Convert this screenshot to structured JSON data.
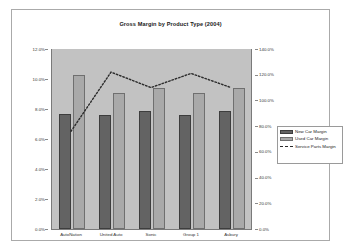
{
  "chart_data": {
    "type": "bar",
    "title": "Gross Margin by Product Type (2004)",
    "xlabel": "",
    "ylabel": "",
    "categories": [
      "AutoNation",
      "United Auto",
      "Sonic",
      "Group 1",
      "Asbury"
    ],
    "series": [
      {
        "name": "New Car Margin",
        "type": "bar",
        "axis": "left",
        "color": "#636363",
        "values": [
          7.7,
          7.6,
          7.9,
          7.6,
          7.9
        ]
      },
      {
        "name": "Used Car Margin",
        "type": "bar",
        "axis": "left",
        "color": "#a9a9a9",
        "values": [
          10.3,
          9.1,
          9.4,
          9.1,
          9.4
        ]
      },
      {
        "name": "Service Parts Margin",
        "type": "line",
        "axis": "right",
        "color": "#2b2b2b",
        "style": "dotted",
        "values": [
          76.0,
          122.0,
          110.0,
          121.0,
          110.0
        ]
      }
    ],
    "left_axis": {
      "ylim": [
        0,
        12
      ],
      "ticks": [
        "0.0%",
        "2.0%",
        "4.0%",
        "6.0%",
        "8.0%",
        "10.0%",
        "12.0%"
      ],
      "tick_values": [
        0,
        2,
        4,
        6,
        8,
        10,
        12
      ]
    },
    "right_axis": {
      "ylim": [
        0,
        140
      ],
      "ticks": [
        "0.0%",
        "20.0%",
        "40.0%",
        "60.0%",
        "80.0%",
        "100.0%",
        "120.0%",
        "140.0%"
      ],
      "tick_values": [
        0,
        20,
        40,
        60,
        80,
        100,
        120,
        140
      ]
    },
    "grid": false,
    "legend_position": "right",
    "legend": [
      "New Car Margin",
      "Used Car Margin",
      "Service Parts Margin"
    ],
    "plot_background": "#c2c2c2",
    "figure_background": "#ffffff"
  }
}
